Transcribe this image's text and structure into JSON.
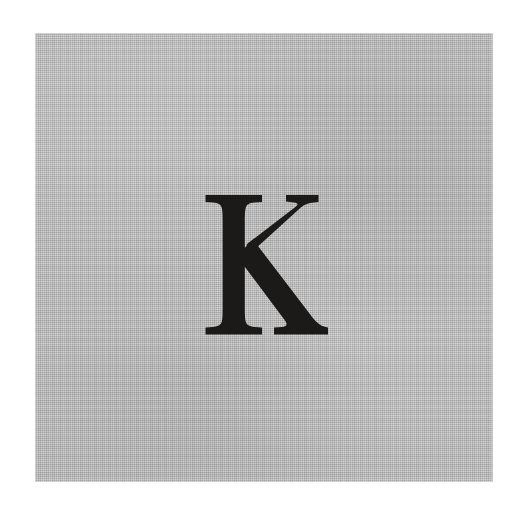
{
  "image": {
    "kind": "letterform-specimen",
    "width": 531,
    "height": 510,
    "background_color": "#ffffff",
    "description": "Scanned specimen of a single capital letter printed on a gray textured panel"
  },
  "panel": {
    "name": "gray-textured-panel",
    "fill_color": "#b6b6b6",
    "texture": "woven-canvas-weave",
    "left": 35,
    "top": 33,
    "width": 458,
    "height": 449
  },
  "glyph": {
    "character": "K",
    "name": "capital-letter-k",
    "ink_color": "#1b1a19",
    "style": "serif",
    "case": "uppercase",
    "left": 203,
    "top": 194,
    "width": 127,
    "height": 141
  }
}
